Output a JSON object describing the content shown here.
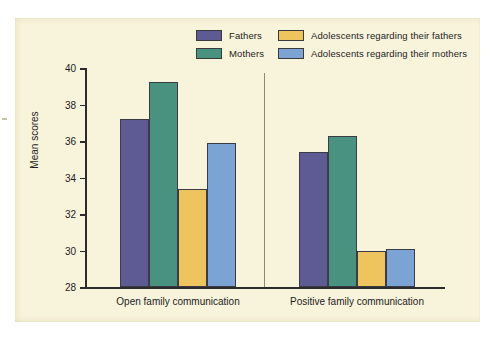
{
  "figure": {
    "background_color": "#f8f3db",
    "page_color": "#ffffff"
  },
  "chart_data": {
    "type": "bar",
    "title": "",
    "xlabel": "",
    "ylabel": "Mean scores",
    "ylim": [
      28,
      40
    ],
    "ytick_step": 2,
    "yticks": [
      "40",
      "38",
      "36",
      "34",
      "32",
      "30",
      "28"
    ],
    "grid": false,
    "legend_position": "top-center",
    "categories": [
      "Open family communication",
      "Positive family communication"
    ],
    "series": [
      {
        "name": "Fathers",
        "color": "#5d5a94",
        "values": [
          37.2,
          35.4
        ]
      },
      {
        "name": "Mothers",
        "color": "#4a9280",
        "values": [
          39.25,
          36.25
        ]
      },
      {
        "name": "Adolescents regarding their fathers",
        "color": "#edc45e",
        "values": [
          33.35,
          30.0
        ]
      },
      {
        "name": "Adolescents regarding their mothers",
        "color": "#7ba3d4",
        "values": [
          35.9,
          30.1
        ]
      }
    ]
  }
}
